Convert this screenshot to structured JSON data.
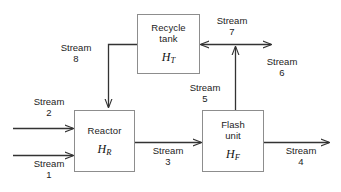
{
  "diagram": {
    "line_color": "#333333",
    "box_border_color": "#8d8d8d",
    "background": "#ffffff",
    "units": [
      {
        "id": "recycle-tank",
        "name_line1": "Recycle",
        "name_line2": "tank",
        "enthalpy_symbol": "H",
        "enthalpy_subscript": "T"
      },
      {
        "id": "reactor",
        "name_line1": "Reactor",
        "name_line2": "",
        "enthalpy_symbol": "H",
        "enthalpy_subscript": "R"
      },
      {
        "id": "flash-unit",
        "name_line1": "Flash",
        "name_line2": "unit",
        "enthalpy_symbol": "H",
        "enthalpy_subscript": "F"
      }
    ],
    "streams": [
      {
        "id": "stream-1",
        "word": "Stream",
        "number": "1"
      },
      {
        "id": "stream-2",
        "word": "Stream",
        "number": "2"
      },
      {
        "id": "stream-3",
        "word": "Stream",
        "number": "3"
      },
      {
        "id": "stream-4",
        "word": "Stream",
        "number": "4"
      },
      {
        "id": "stream-5",
        "word": "Stream",
        "number": "5"
      },
      {
        "id": "stream-6",
        "word": "Stream",
        "number": "6"
      },
      {
        "id": "stream-7",
        "word": "Stream",
        "number": "7"
      },
      {
        "id": "stream-8",
        "word": "Stream",
        "number": "8"
      }
    ]
  }
}
